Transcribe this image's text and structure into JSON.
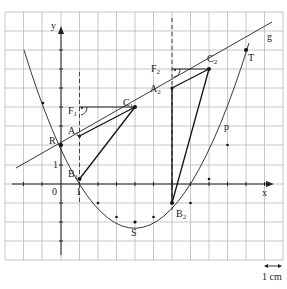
{
  "diagram": {
    "grid": {
      "cols": 15,
      "rows": 13,
      "color": "#b8b8b8"
    },
    "axes": {
      "x_label": "x",
      "y_label": "y",
      "origin_label": "0",
      "x_unit_label": "1",
      "y_unit_label": "1"
    },
    "scale": {
      "label": "1 cm"
    },
    "curves": {
      "parabola": {
        "name": "p",
        "equation": "y = 0.25(x-4)^2 - 2",
        "vertex": [
          4,
          -2
        ]
      },
      "line": {
        "name": "g",
        "equation": "y = 0.5x + 2"
      }
    },
    "points": {
      "R": {
        "label": "R",
        "coords": [
          0,
          2
        ]
      },
      "S": {
        "label": "S",
        "coords": [
          4,
          -2
        ]
      },
      "T": {
        "label": "T",
        "coords": [
          10,
          7
        ]
      },
      "A1": {
        "label": "A",
        "sub": "1",
        "coords": [
          1,
          2.5
        ]
      },
      "B1": {
        "label": "B",
        "sub": "1",
        "coords": [
          1,
          0.25
        ]
      },
      "C1": {
        "label": "C",
        "sub": "1",
        "coords": [
          4,
          4
        ]
      },
      "F1": {
        "label": "F",
        "sub": "1",
        "coords": [
          1,
          4
        ]
      },
      "A2": {
        "label": "A",
        "sub": "2",
        "coords": [
          6,
          5
        ]
      },
      "B2": {
        "label": "B",
        "sub": "2",
        "coords": [
          6,
          -1
        ]
      },
      "C2": {
        "label": "C",
        "sub": "2",
        "coords": [
          8,
          6
        ]
      },
      "F2": {
        "label": "F",
        "sub": "2",
        "coords": [
          6,
          6
        ]
      }
    }
  }
}
